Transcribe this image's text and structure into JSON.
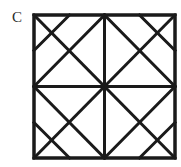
{
  "label": "C",
  "figure": {
    "type": "square-with-diagonals-and-diamond",
    "stroke_color": "#1a1a1a",
    "stroke_width": 3,
    "square": {
      "x1": 34,
      "y1": 15,
      "x2": 175,
      "y2": 158
    },
    "lines": [
      {
        "name": "diagonal-tl-br",
        "x1": 34,
        "y1": 15,
        "x2": 175,
        "y2": 158
      },
      {
        "name": "diagonal-tr-bl",
        "x1": 175,
        "y1": 15,
        "x2": 34,
        "y2": 158
      },
      {
        "name": "vertical-midline",
        "x1": 104.5,
        "y1": 15,
        "x2": 104.5,
        "y2": 158
      },
      {
        "name": "horizontal-midline",
        "x1": 34,
        "y1": 86.5,
        "x2": 175,
        "y2": 86.5
      },
      {
        "name": "diamond-top-right",
        "x1": 104.5,
        "y1": 15,
        "x2": 175,
        "y2": 86.5
      },
      {
        "name": "diamond-right-bottom",
        "x1": 175,
        "y1": 86.5,
        "x2": 104.5,
        "y2": 158
      },
      {
        "name": "diamond-bottom-left",
        "x1": 104.5,
        "y1": 158,
        "x2": 34,
        "y2": 86.5
      },
      {
        "name": "diamond-left-top",
        "x1": 34,
        "y1": 86.5,
        "x2": 104.5,
        "y2": 15
      },
      {
        "name": "corner-cut-top-left",
        "x1": 69.5,
        "y1": 15,
        "x2": 34,
        "y2": 50.5
      },
      {
        "name": "corner-cut-top-right",
        "x1": 139.5,
        "y1": 15,
        "x2": 175,
        "y2": 50.5
      },
      {
        "name": "corner-cut-bottom-left",
        "x1": 34,
        "y1": 122.5,
        "x2": 69.5,
        "y2": 158
      },
      {
        "name": "corner-cut-bottom-right",
        "x1": 175,
        "y1": 122.5,
        "x2": 139.5,
        "y2": 158
      }
    ]
  }
}
